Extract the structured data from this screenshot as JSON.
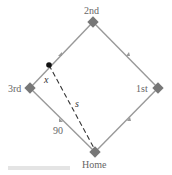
{
  "diagram": {
    "bases": {
      "second": "2nd",
      "third": "3rd",
      "first": "1st",
      "home": "Home"
    },
    "labels": {
      "runner_distance": "x",
      "distance_to_home": "s",
      "side_length": "90"
    },
    "colors": {
      "baseline": "#999999",
      "base": "#777777",
      "dashed": "#333333",
      "runner": "#111111",
      "text": "#666666"
    }
  }
}
